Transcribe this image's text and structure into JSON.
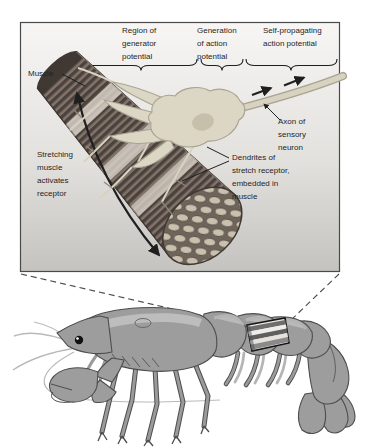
{
  "palette": {
    "ink": "#1f1f1f",
    "panel_top": "#f6f5f3",
    "panel_bottom": "#c5c3c0",
    "panel_border": "#4a4a4a",
    "muscle_base": "#82756b",
    "muscle_stripe": "#4d423e",
    "muscle_band": "#dbd4cb",
    "fiber_face": "#6f6459",
    "fiber_cell": "#c9c0ae",
    "fiber_cell_edge": "#57504a",
    "neuron_fill": "#dcd6c5",
    "neuron_edge": "#a9a392",
    "nucleus": "#c6bfa9",
    "axon_fill": "#d8d2c1",
    "body_gray": "#9d9d9d",
    "body_edge": "#4d4d4d",
    "body_highlight": "#c6c6c6",
    "leg_gray": "#9a9a9a",
    "antenna_gray": "#b9b9b9",
    "dash": "#4a4a4a",
    "stripe_dark": "#636363",
    "stripe_light": "#eae7e2"
  },
  "figure": {
    "panel": {
      "region_generator_label": "Region of\ngenerator\npotential",
      "generation_action_label": "Generation\nof action\npotential",
      "self_propagating_label": "Self-propagating\naction potential",
      "muscle_label": "Muscle",
      "stretching_label": "Stretching\nmuscle\nactivates\nreceptor",
      "axon_label": "Axon of\nsensory\nneuron",
      "dendrites_label": "Dendrites of\nstretch receptor,\nembedded in\nmuscle"
    }
  }
}
